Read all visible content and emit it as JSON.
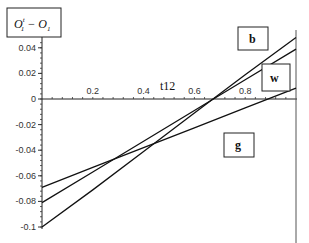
{
  "chart_data": {
    "type": "line",
    "xlabel": "t12",
    "ylabel": "O_1^t - O_1",
    "xlim": [
      0,
      1
    ],
    "ylim": [
      -0.1,
      0.045
    ],
    "grid": false,
    "x_ticks": [
      "0.2",
      "0.4",
      "0.6",
      "0.8"
    ],
    "y_ticks": [
      "0.04",
      "0.02",
      "0",
      "-0.02",
      "-0.04",
      "-0.06",
      "-0.08",
      "-0.1"
    ],
    "series": [
      {
        "name": "b",
        "x": [
          0,
          0.2,
          0.4,
          0.6,
          0.8,
          1.0
        ],
        "values": [
          -0.1,
          -0.071,
          -0.041,
          -0.011,
          0.019,
          0.048
        ]
      },
      {
        "name": "w",
        "x": [
          0,
          0.2,
          0.4,
          0.6,
          0.8,
          1.0
        ],
        "values": [
          -0.081,
          -0.057,
          -0.033,
          -0.009,
          0.015,
          0.039
        ]
      },
      {
        "name": "g",
        "x": [
          0,
          0.2,
          0.4,
          0.6,
          0.8,
          1.0
        ],
        "values": [
          -0.069,
          -0.0535,
          -0.038,
          -0.0225,
          -0.007,
          0.0085
        ]
      }
    ],
    "annotations": [
      "b",
      "w",
      "g"
    ]
  },
  "labels": {
    "y_title_main": "O",
    "y_title_sup": "t",
    "y_title_sub": "1",
    "y_title_minus": " − O",
    "y_title_sub2": "1",
    "x_title": "t12",
    "box_b": "b",
    "box_w": "w",
    "box_g": "g"
  }
}
